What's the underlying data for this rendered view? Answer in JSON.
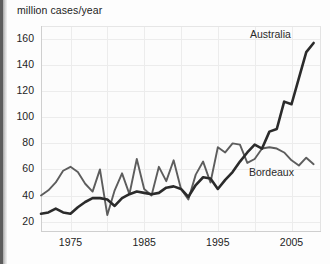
{
  "chart_data": {
    "type": "line",
    "title": "million cases/year",
    "ylabel": "million cases/year",
    "xlabel": "",
    "xlim": [
      1971,
      2009
    ],
    "ylim": [
      12,
      170
    ],
    "yticks": [
      20,
      40,
      60,
      80,
      100,
      120,
      140,
      160
    ],
    "xticks": [
      1975,
      1985,
      1995,
      2005
    ],
    "grid": true,
    "legend_position": "inline-annotations",
    "annotations": [
      "Australia",
      "Bordeaux"
    ],
    "x": [
      1971,
      1972,
      1973,
      1974,
      1975,
      1976,
      1977,
      1978,
      1979,
      1980,
      1981,
      1982,
      1983,
      1984,
      1985,
      1986,
      1987,
      1988,
      1989,
      1990,
      1991,
      1992,
      1993,
      1994,
      1995,
      1996,
      1997,
      1998,
      1999,
      2000,
      2001,
      2002,
      2003,
      2004,
      2005,
      2006,
      2007,
      2008
    ],
    "series": [
      {
        "name": "Australia",
        "color": "#2b2b2b",
        "values": [
          26,
          27,
          30,
          27,
          26,
          31,
          35,
          38,
          38,
          37,
          32,
          38,
          41,
          43,
          42,
          41,
          42,
          46,
          47,
          45,
          39,
          48,
          54,
          53,
          45,
          52,
          58,
          66,
          73,
          79,
          76,
          89,
          91,
          112,
          110,
          130,
          150,
          157
        ]
      },
      {
        "name": "Bordeaux",
        "color": "#5d5d5d",
        "values": [
          40,
          44,
          50,
          59,
          62,
          58,
          49,
          43,
          60,
          25,
          44,
          57,
          41,
          68,
          45,
          40,
          62,
          51,
          67,
          45,
          37,
          56,
          66,
          50,
          77,
          73,
          80,
          79,
          65,
          68,
          76,
          77,
          76,
          73,
          67,
          63,
          69,
          64
        ]
      }
    ]
  },
  "chart": {
    "y_axis_title": "million cases/year",
    "y_tick_labels": [
      "160",
      "140",
      "120",
      "100",
      "80",
      "60",
      "40",
      "20"
    ],
    "x_tick_labels": [
      "1975",
      "1985",
      "1995",
      "2005"
    ],
    "label_australia": "Australia",
    "label_bordeaux": "Bordeaux",
    "colors": {
      "australia": "#2b2b2b",
      "bordeaux": "#5d5d5d",
      "grid": "#ececec",
      "background": "#fcfcfc"
    }
  }
}
